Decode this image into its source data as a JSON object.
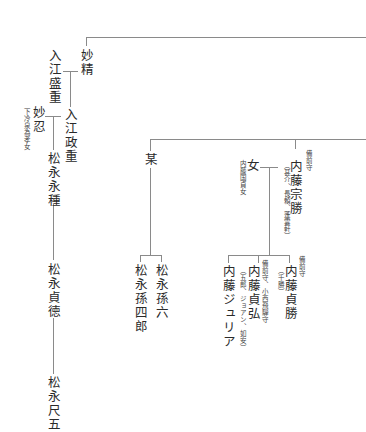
{
  "chart": {
    "persons": {
      "myosei": "妙精",
      "irie_morishige": "入江盛重",
      "irie_masashige": "入江政重",
      "myonin": "妙忍",
      "myonin_note": "下冷泉為孝女",
      "matsunaga_nagatane": "松永永種",
      "matsunaga_teitoku": "松永貞徳",
      "matsunaga_sekigo": "松永尺五",
      "bou": "某",
      "matsunaga_magoroku": "松永孫六",
      "matsunaga_magoshiro": "松永孫四郎",
      "naito_munekatsu": "内藤宗勝",
      "naito_munekatsu_title": "備前守",
      "naito_munekatsu_alias": "（甚介、長頼、蓬雲軒）",
      "onna": "女",
      "onna_note": "内藤国貞女",
      "naito_sadakatsu": "内藤貞勝",
      "naito_sadakatsu_title": "備前守",
      "naito_sadakatsu_alias": "（千勝）",
      "naito_tadahiro": "内藤貞弘",
      "naito_tadahiro_title": "備前守、小西飛騨守",
      "naito_tadahiro_alias": "（五郎、ジョアン、如安）",
      "naito_julia": "内藤ジュリア"
    }
  }
}
